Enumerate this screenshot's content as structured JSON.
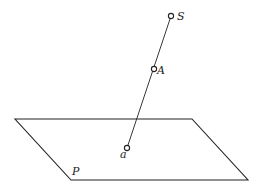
{
  "diagram": {
    "colors": {
      "stroke": "#222222",
      "background": "#ffffff"
    },
    "plane": {
      "label": "P",
      "vertices": [
        [
          15,
          119
        ],
        [
          192,
          119
        ],
        [
          248,
          180
        ],
        [
          71,
          180
        ]
      ],
      "label_pos": [
        72,
        175
      ]
    },
    "points": [
      {
        "id": "S",
        "label": "S",
        "x": 171,
        "y": 16,
        "label_x": 177,
        "label_y": 20
      },
      {
        "id": "A",
        "label": "A",
        "x": 154,
        "y": 69,
        "label_x": 157,
        "label_y": 74
      },
      {
        "id": "a",
        "label": "a",
        "x": 127,
        "y": 148,
        "label_x": 120,
        "label_y": 158
      }
    ],
    "projection_line": {
      "from": "S",
      "to": "a"
    }
  }
}
